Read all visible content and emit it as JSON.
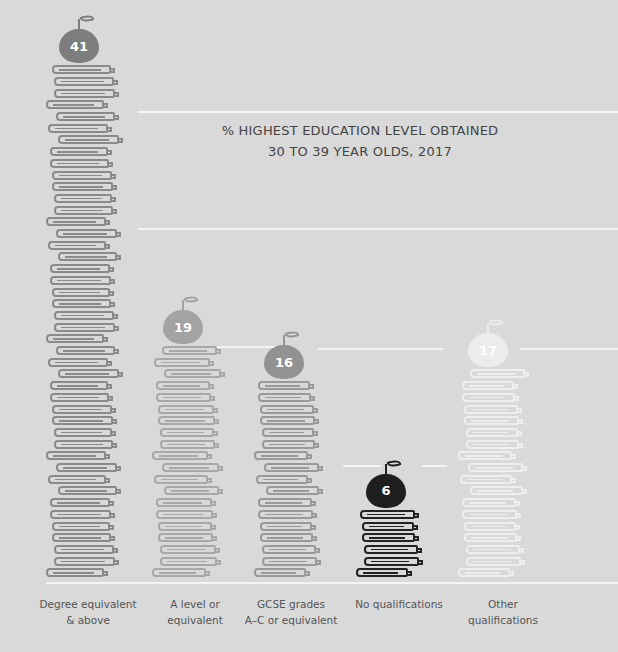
{
  "chart_data": {
    "type": "bar",
    "style": "pictogram - stacked books topped with apples showing value",
    "title": "% HIGHEST EDUCATION LEVEL OBTAINED",
    "subtitle": "30 TO 39 YEAR OLDS, 2017",
    "categories": [
      "Degree equivalent & above",
      "A level or equivalent",
      "GCSE grades A–C or equivalent",
      "No qualifications",
      "Other qualifications"
    ],
    "values": [
      41,
      19,
      16,
      6,
      17
    ],
    "unit": "%",
    "ylim": [
      0,
      45
    ],
    "grid": true,
    "xlabel": "",
    "ylabel": ""
  },
  "title": {
    "line1": "% HIGHEST EDUCATION LEVEL OBTAINED",
    "line2": "30 TO 39 YEAR OLDS, 2017"
  },
  "bars": [
    {
      "label": "Degree equivalent\n& above",
      "value": "41",
      "color": "#8a8a8a",
      "apple_color": "#7d7d7d"
    },
    {
      "label": "A level or\nequivalent",
      "value": "19",
      "color": "#a8a8a8",
      "apple_color": "#a3a3a3"
    },
    {
      "label": "GCSE grades\nA–C or equivalent",
      "value": "16",
      "color": "#999999",
      "apple_color": "#929292"
    },
    {
      "label": "No qualifications",
      "value": "6",
      "color": "#222222",
      "apple_color": "#1e1e1e"
    },
    {
      "label": "Other\nqualifications",
      "value": "17",
      "color": "#eeeeee",
      "apple_color": "#ececec"
    }
  ]
}
